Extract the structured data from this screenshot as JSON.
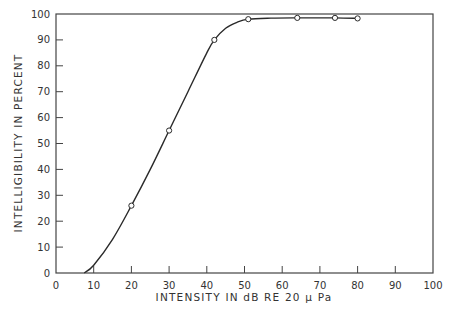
{
  "chart_data": {
    "type": "line",
    "title": "",
    "xlabel": "INTENSITY IN dB RE 20 μ Pa",
    "ylabel": "INTELLIGIBILITY IN PERCENT",
    "xlim": [
      0,
      100
    ],
    "ylim": [
      0,
      100
    ],
    "x_ticks": [
      0,
      10,
      20,
      30,
      40,
      50,
      60,
      70,
      80,
      90,
      100
    ],
    "y_ticks": [
      0,
      10,
      20,
      30,
      40,
      50,
      60,
      70,
      80,
      90,
      100
    ],
    "grid": false,
    "legend": "none",
    "series": [
      {
        "name": "Intelligibility",
        "markers": "open-circle",
        "points": [
          {
            "x": 20,
            "y": 26
          },
          {
            "x": 30,
            "y": 55
          },
          {
            "x": 42,
            "y": 90
          },
          {
            "x": 51,
            "y": 98
          },
          {
            "x": 64,
            "y": 98.5
          },
          {
            "x": 74,
            "y": 98.5
          },
          {
            "x": 80,
            "y": 98.3
          }
        ],
        "curve": [
          {
            "x": 7.5,
            "y": 0
          },
          {
            "x": 10,
            "y": 3
          },
          {
            "x": 15,
            "y": 13
          },
          {
            "x": 20,
            "y": 26
          },
          {
            "x": 25,
            "y": 40
          },
          {
            "x": 30,
            "y": 55
          },
          {
            "x": 35,
            "y": 70
          },
          {
            "x": 40,
            "y": 85
          },
          {
            "x": 42,
            "y": 90
          },
          {
            "x": 45,
            "y": 94.5
          },
          {
            "x": 48,
            "y": 96.8
          },
          {
            "x": 51,
            "y": 98
          },
          {
            "x": 57,
            "y": 98.4
          },
          {
            "x": 64,
            "y": 98.5
          },
          {
            "x": 74,
            "y": 98.5
          },
          {
            "x": 80,
            "y": 98.3
          }
        ]
      }
    ]
  }
}
